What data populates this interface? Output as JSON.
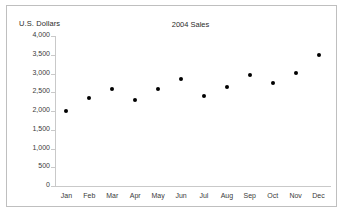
{
  "chart_data": {
    "type": "scatter",
    "title": "2004 Sales",
    "xlabel": "",
    "ylabel": "U.S. Dollars",
    "categories": [
      "Jan",
      "Feb",
      "Mar",
      "Apr",
      "May",
      "Jun",
      "Jul",
      "Aug",
      "Sep",
      "Oct",
      "Nov",
      "Dec"
    ],
    "values": [
      2000,
      2350,
      2600,
      2300,
      2580,
      2850,
      2400,
      2650,
      2950,
      2760,
      3010,
      3500
    ],
    "series": [
      {
        "name": "Sales",
        "values": [
          2000,
          2350,
          2600,
          2300,
          2580,
          2850,
          2400,
          2650,
          2950,
          2760,
          3010,
          3500
        ]
      }
    ],
    "ylim": [
      0,
      4000
    ],
    "ytick_values": [
      4000,
      3500,
      3000,
      2500,
      2000,
      1500,
      1000,
      500,
      0
    ],
    "ytick_labels": [
      "4,000",
      "3,500",
      "3,000",
      "2,500",
      "2,000",
      "1,500",
      "1,000",
      "500",
      "0"
    ],
    "grid": false,
    "legend": "none",
    "marker_color": "#000000",
    "axis_color": "#c9c9c9",
    "border_color": "#bfbfbf",
    "background": "#ffffff"
  }
}
